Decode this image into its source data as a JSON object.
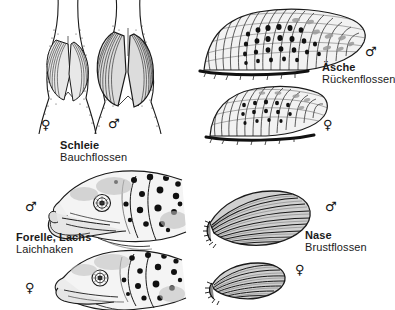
{
  "plate": {
    "title": "Geschlechtsmerkmale bei Fischen",
    "background_color": "#ffffff",
    "ink_color": "#1a1a1a",
    "width": 389,
    "height": 310
  },
  "symbols": {
    "male": "♂",
    "female": "♀"
  },
  "figures": [
    {
      "id": "schleie",
      "species": "Schleie",
      "part": "Bauchflossen",
      "caption_x": 60,
      "caption_y": 139,
      "specimens": [
        {
          "sex": "female",
          "symbol": "♀",
          "x": 41,
          "y": 118
        },
        {
          "sex": "male",
          "symbol": "♂",
          "x": 108,
          "y": 117
        }
      ]
    },
    {
      "id": "aesche",
      "species": "Äsche",
      "part": "Rückenflossen",
      "caption_x": 322,
      "caption_y": 61,
      "specimens": [
        {
          "sex": "male",
          "symbol": "♂",
          "x": 365,
          "y": 45
        },
        {
          "sex": "female",
          "symbol": "♀",
          "x": 323,
          "y": 118
        }
      ]
    },
    {
      "id": "forelle-lachs",
      "species": "Forelle, Lachs",
      "part": "Laichhaken",
      "caption_x": 16,
      "caption_y": 231,
      "specimens": [
        {
          "sex": "male",
          "symbol": "♂",
          "x": 25,
          "y": 200
        },
        {
          "sex": "female",
          "symbol": "♀",
          "x": 25,
          "y": 281
        }
      ]
    },
    {
      "id": "nase",
      "species": "Nase",
      "part": "Brustflossen",
      "caption_x": 305,
      "caption_y": 229,
      "specimens": [
        {
          "sex": "male",
          "symbol": "♂",
          "x": 325,
          "y": 200
        },
        {
          "sex": "female",
          "symbol": "♀",
          "x": 295,
          "y": 263
        }
      ]
    }
  ]
}
